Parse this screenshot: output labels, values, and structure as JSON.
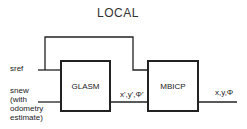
{
  "title": "LOCAL",
  "inputs": {
    "sref": "sref",
    "snew_lines": [
      "snew",
      "(with",
      "odometry",
      "estimate)"
    ]
  },
  "blocks": {
    "glasm": "GLASM",
    "mbicp": "MBICP"
  },
  "signals": {
    "intermediate": "x',y',Φ'",
    "output": "x,y,Φ"
  },
  "colors": {
    "line": "#222222",
    "background": "#ffffff"
  }
}
